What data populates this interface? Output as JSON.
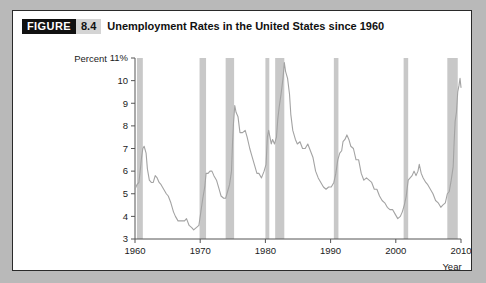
{
  "figure": {
    "badge_label": "FIGURE",
    "number": "8.4",
    "title": "Unemployment Rates in the United States since 1960"
  },
  "colors": {
    "page_background": "#b9b9b9",
    "card_background": "#ffffff",
    "card_border": "#2a2a2a",
    "badge_background": "#111111",
    "badge_text": "#ffffff",
    "number_background": "#d4d4d4",
    "recession_band": "#c8c8c8",
    "series_line": "#a3a3a3",
    "axis": "#555555",
    "text": "#1b1b1b"
  },
  "chart_data": {
    "type": "line",
    "title": "Unemployment Rates in the United States since 1960",
    "xlabel": "Year",
    "ylabel": "Percent",
    "xlim": [
      1960,
      2010
    ],
    "ylim": [
      3,
      11
    ],
    "grid": false,
    "legend": null,
    "y_ticks": [
      "3",
      "4",
      "5",
      "6",
      "7",
      "8",
      "9",
      "10",
      "11%"
    ],
    "y_tick_values": [
      3,
      4,
      5,
      6,
      7,
      8,
      9,
      10,
      11
    ],
    "x_ticks": [
      "1960",
      "1970",
      "1980",
      "1990",
      "2000",
      "2010"
    ],
    "x_tick_values": [
      1960,
      1970,
      1980,
      1990,
      2000,
      2010
    ],
    "series": [
      {
        "name": "Unemployment rate",
        "x": [
          1960.0,
          1960.3,
          1960.6,
          1960.9,
          1961.0,
          1961.2,
          1961.4,
          1961.7,
          1961.9,
          1962.2,
          1962.5,
          1962.8,
          1963.1,
          1963.4,
          1963.7,
          1964.0,
          1964.4,
          1964.8,
          1965.1,
          1965.5,
          1965.9,
          1966.2,
          1966.6,
          1966.9,
          1967.3,
          1967.6,
          1967.9,
          1968.3,
          1968.7,
          1969.0,
          1969.4,
          1969.8,
          1970.1,
          1970.4,
          1970.7,
          1970.9,
          1971.2,
          1971.5,
          1971.8,
          1972.1,
          1972.5,
          1972.9,
          1973.2,
          1973.6,
          1973.9,
          1974.2,
          1974.5,
          1974.8,
          1974.95,
          1975.1,
          1975.3,
          1975.5,
          1975.8,
          1976.1,
          1976.5,
          1976.9,
          1977.2,
          1977.6,
          1977.9,
          1978.3,
          1978.7,
          1979.0,
          1979.4,
          1979.8,
          1980.1,
          1980.3,
          1980.5,
          1980.7,
          1980.9,
          1981.1,
          1981.4,
          1981.7,
          1981.9,
          1982.1,
          1982.4,
          1982.7,
          1982.9,
          1983.1,
          1983.4,
          1983.7,
          1983.9,
          1984.2,
          1984.6,
          1984.9,
          1985.3,
          1985.7,
          1986.1,
          1986.5,
          1986.9,
          1987.3,
          1987.7,
          1988.1,
          1988.5,
          1988.9,
          1989.3,
          1989.7,
          1990.1,
          1990.5,
          1990.8,
          1991.1,
          1991.4,
          1991.7,
          1991.9,
          1992.2,
          1992.5,
          1992.8,
          1993.1,
          1993.5,
          1993.9,
          1994.3,
          1994.7,
          1995.1,
          1995.5,
          1995.9,
          1996.3,
          1996.7,
          1997.1,
          1997.5,
          1997.9,
          1998.3,
          1998.7,
          1999.1,
          1999.5,
          1999.9,
          2000.3,
          2000.7,
          2001.0,
          2001.3,
          2001.6,
          2001.9,
          2002.2,
          2002.5,
          2002.8,
          2003.1,
          2003.4,
          2003.6,
          2003.9,
          2004.2,
          2004.6,
          2004.9,
          2005.3,
          2005.7,
          2006.1,
          2006.5,
          2006.9,
          2007.2,
          2007.6,
          2007.9,
          2008.2,
          2008.5,
          2008.8,
          2008.95,
          2009.1,
          2009.3,
          2009.5,
          2009.7,
          2009.85,
          2010.0
        ],
        "y": [
          5.2,
          5.4,
          5.5,
          6.3,
          6.6,
          7.0,
          7.1,
          6.8,
          6.1,
          5.6,
          5.5,
          5.5,
          5.8,
          5.7,
          5.5,
          5.4,
          5.2,
          5.0,
          4.9,
          4.6,
          4.2,
          4.0,
          3.8,
          3.8,
          3.8,
          3.8,
          3.9,
          3.6,
          3.5,
          3.4,
          3.5,
          3.6,
          4.2,
          4.8,
          5.3,
          5.9,
          5.9,
          6.0,
          6.0,
          5.8,
          5.6,
          5.2,
          4.9,
          4.8,
          4.8,
          5.1,
          5.4,
          6.0,
          7.2,
          8.1,
          8.9,
          8.6,
          8.4,
          7.7,
          7.7,
          7.8,
          7.5,
          7.0,
          6.7,
          6.3,
          5.9,
          5.9,
          5.7,
          6.0,
          6.3,
          7.5,
          7.8,
          7.5,
          7.2,
          7.4,
          7.2,
          7.5,
          8.3,
          8.8,
          9.4,
          10.1,
          10.8,
          10.4,
          10.1,
          9.4,
          8.5,
          7.8,
          7.4,
          7.2,
          7.3,
          7.0,
          7.0,
          7.2,
          6.9,
          6.6,
          6.0,
          5.7,
          5.5,
          5.3,
          5.2,
          5.3,
          5.3,
          5.5,
          5.9,
          6.5,
          6.8,
          6.9,
          7.3,
          7.4,
          7.6,
          7.4,
          7.1,
          7.0,
          6.5,
          6.5,
          5.9,
          5.6,
          5.7,
          5.6,
          5.5,
          5.2,
          5.2,
          4.9,
          4.7,
          4.6,
          4.4,
          4.3,
          4.3,
          4.1,
          3.9,
          4.0,
          4.2,
          4.5,
          4.9,
          5.6,
          5.7,
          5.8,
          6.0,
          5.8,
          6.0,
          6.3,
          5.9,
          5.7,
          5.5,
          5.4,
          5.2,
          5.0,
          4.7,
          4.6,
          4.4,
          4.5,
          4.6,
          5.0,
          5.1,
          5.6,
          6.2,
          7.3,
          8.2,
          8.6,
          9.5,
          9.8,
          10.1,
          9.7
        ]
      }
    ],
    "recession_bands": [
      {
        "start": 1960.3,
        "end": 1961.2,
        "label": "1960-61 recession"
      },
      {
        "start": 1969.9,
        "end": 1970.9,
        "label": "1969-70 recession"
      },
      {
        "start": 1973.9,
        "end": 1975.2,
        "label": "1973-75 recession"
      },
      {
        "start": 1980.0,
        "end": 1980.6,
        "label": "1980 recession"
      },
      {
        "start": 1981.5,
        "end": 1982.9,
        "label": "1981-82 recession"
      },
      {
        "start": 1990.5,
        "end": 1991.2,
        "label": "1990-91 recession"
      },
      {
        "start": 2001.2,
        "end": 2001.9,
        "label": "2001 recession"
      },
      {
        "start": 2007.9,
        "end": 2009.5,
        "label": "2007-09 recession"
      }
    ]
  }
}
